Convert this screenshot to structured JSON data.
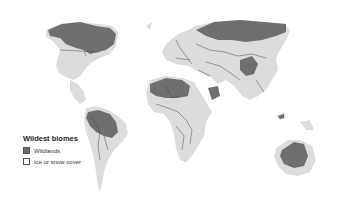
{
  "map": {
    "title": "Wildest biomes",
    "colors": {
      "background": "#ffffff",
      "land": "#dcdcdc",
      "wildlands": "#6f6f6f",
      "borders": "#4a4a4a",
      "ice_or_snow": "#ffffff"
    }
  },
  "legend": {
    "title": "Wildest biomes",
    "items": [
      {
        "label": "Wildlands",
        "swatch": "wildlands",
        "color": "#6f6f6f"
      },
      {
        "label": "Ice or snow cover",
        "swatch": "ice-or-snow",
        "color": "#ffffff"
      }
    ]
  }
}
